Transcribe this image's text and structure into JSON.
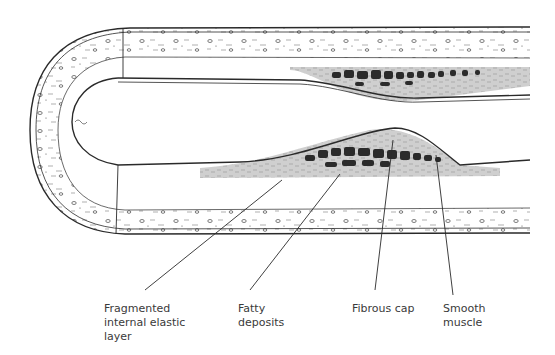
{
  "figure": {
    "colors": {
      "outline": "#2a2a2a",
      "wall_fill": "#ffffff",
      "plaque_fill": "#cfcfcf",
      "lipid_blobs": "#2b2b2b",
      "label_text": "#3a3a3a"
    }
  },
  "labels": [
    {
      "id": "fragmented",
      "text": "Fragmented\ninternal elastic\nlayer"
    },
    {
      "id": "fatty",
      "text": "Fatty\ndeposits"
    },
    {
      "id": "fibrous",
      "text": "Fibrous cap"
    },
    {
      "id": "smooth",
      "text": "Smooth\nmuscle"
    }
  ]
}
